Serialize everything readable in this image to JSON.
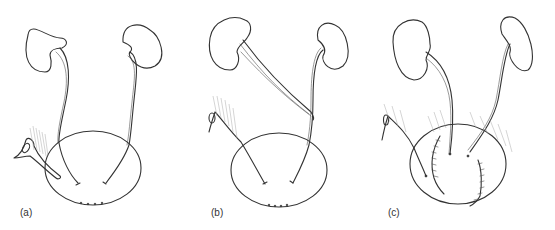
{
  "figure": {
    "panels": [
      {
        "id": "a",
        "label": "(a)"
      },
      {
        "id": "b",
        "label": "(b)"
      },
      {
        "id": "c",
        "label": "(c)"
      }
    ],
    "colors": {
      "line": "#333333",
      "hatch": "#aaaaaa",
      "background": "#ffffff"
    }
  }
}
